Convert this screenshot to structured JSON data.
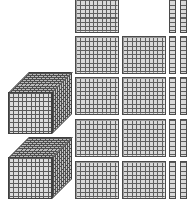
{
  "scene": {
    "title": "Base Ten Blocks",
    "background_color": "#ffffff",
    "width": 192,
    "height": 205
  },
  "palette": {
    "unit_fill": "#d9d9d9",
    "grid_line": "#5f5f5f",
    "block_outline": "#4a4a4a",
    "cube_top_fill": "#b9b9b9",
    "cube_right_fill": "#c6c6c6",
    "cube_front_fill": "#dcdcdc"
  },
  "manipulative": {
    "kind": "base-ten-blocks",
    "groups": [
      {
        "name": "thousands",
        "piece_label": "cube",
        "unit_value": 1000,
        "count": 2,
        "group_value": 2000
      },
      {
        "name": "hundreds",
        "piece_label": "flat",
        "unit_value": 100,
        "count": 9,
        "group_value": 900
      },
      {
        "name": "tens",
        "piece_label": "rod",
        "unit_value": 10,
        "count": 10,
        "group_value": 100
      },
      {
        "name": "ones",
        "piece_label": "unit",
        "unit_value": 1,
        "count": 0,
        "group_value": 0
      }
    ],
    "total_value": 3000
  },
  "cubes": [
    {
      "id": "cube-1",
      "x": 8,
      "y": 72,
      "value": 1000
    },
    {
      "id": "cube-2",
      "x": 8,
      "y": 137,
      "value": 1000
    }
  ],
  "flats": [
    {
      "id": "flat-1",
      "x": 75,
      "y": -5,
      "value": 100
    },
    {
      "id": "flat-2",
      "x": 75,
      "y": 36,
      "value": 100
    },
    {
      "id": "flat-3",
      "x": 122,
      "y": 36,
      "value": 100
    },
    {
      "id": "flat-4",
      "x": 75,
      "y": 77,
      "value": 100
    },
    {
      "id": "flat-5",
      "x": 122,
      "y": 77,
      "value": 100
    },
    {
      "id": "flat-6",
      "x": 75,
      "y": 119,
      "value": 100
    },
    {
      "id": "flat-7",
      "x": 122,
      "y": 119,
      "value": 100
    },
    {
      "id": "flat-8",
      "x": 75,
      "y": 161,
      "value": 100
    },
    {
      "id": "flat-9",
      "x": 122,
      "y": 161,
      "value": 100
    }
  ],
  "rods": [
    {
      "id": "rod-1",
      "x": 169,
      "y": -5,
      "value": 10
    },
    {
      "id": "rod-2",
      "x": 180,
      "y": -5,
      "value": 10
    },
    {
      "id": "rod-3",
      "x": 169,
      "y": 36,
      "value": 10
    },
    {
      "id": "rod-4",
      "x": 180,
      "y": 36,
      "value": 10
    },
    {
      "id": "rod-5",
      "x": 169,
      "y": 77,
      "value": 10
    },
    {
      "id": "rod-6",
      "x": 180,
      "y": 77,
      "value": 10
    },
    {
      "id": "rod-7",
      "x": 169,
      "y": 119,
      "value": 10
    },
    {
      "id": "rod-8",
      "x": 180,
      "y": 119,
      "value": 10
    },
    {
      "id": "rod-9",
      "x": 169,
      "y": 161,
      "value": 10
    },
    {
      "id": "rod-10",
      "x": 180,
      "y": 161,
      "value": 10
    }
  ]
}
